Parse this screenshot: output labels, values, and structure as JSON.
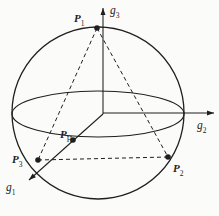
{
  "diagram": {
    "background": "#fbfbf9",
    "stroke": "#1f1f1d",
    "dash_pattern": "4 3",
    "sphere": {
      "cx": 98,
      "cy": 113,
      "r": 86
    },
    "equator": {
      "cx": 98,
      "cy": 114,
      "rx": 86,
      "ry": 23
    },
    "axes": [
      {
        "id": "g3",
        "x1": 103,
        "y1": 114,
        "x2": 103,
        "y2": 8,
        "label": {
          "main": "g",
          "sub": "3",
          "x": 110,
          "y": 1
        }
      },
      {
        "id": "g2",
        "x1": 103,
        "y1": 113,
        "x2": 214,
        "y2": 113,
        "label": {
          "main": "g",
          "sub": "2",
          "x": 197,
          "y": 116
        }
      },
      {
        "id": "g1",
        "x1": 103,
        "y1": 114,
        "x2": 29,
        "y2": 180,
        "label": {
          "main": "g",
          "sub": "1",
          "x": 6,
          "y": 178
        }
      }
    ],
    "points": [
      {
        "id": "P1",
        "x": 97,
        "y": 28,
        "label": {
          "main": "P",
          "sub": "1",
          "x": 74,
          "y": 9
        }
      },
      {
        "id": "P2",
        "x": 168,
        "y": 157,
        "label": {
          "main": "P",
          "sub": "2",
          "x": 173,
          "y": 159
        }
      },
      {
        "id": "P3",
        "x": 38,
        "y": 160,
        "label": {
          "main": "P",
          "sub": "3",
          "x": 12,
          "y": 150
        }
      },
      {
        "id": "PH",
        "x": 73,
        "y": 140,
        "label": {
          "main": "P",
          "sub": "H",
          "x": 60,
          "y": 125
        }
      }
    ],
    "dashed_edges": [
      [
        "P1",
        "P2"
      ],
      [
        "P1",
        "P3"
      ],
      [
        "P3",
        "P2"
      ]
    ]
  }
}
